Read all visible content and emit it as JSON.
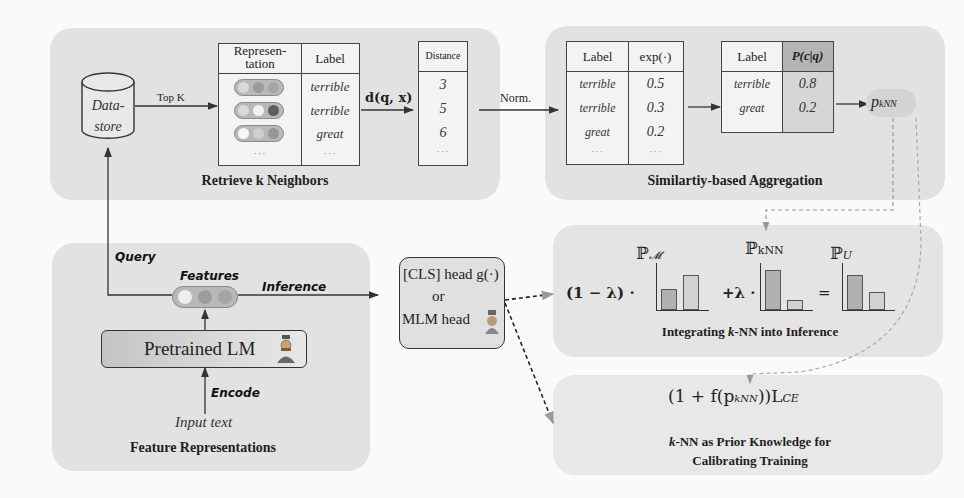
{
  "colors": {
    "background": "#fafafa",
    "panel": "#e2e2e2",
    "header_highlight": "#bdbdbd",
    "line": "#333333",
    "dashed": "#999999"
  },
  "retrieve": {
    "title": "Retrieve k Neighbors",
    "datastore_label_line1": "Data-",
    "datastore_label_line2": "store",
    "topk_label": "Top K",
    "table": {
      "headers": [
        "Represen-tation",
        "Label"
      ],
      "header_line1": "Represen-",
      "header_line2": "tation",
      "label_header": "Label",
      "rows": [
        {
          "dots": [
            "#d8d8d8",
            "#9a9a9a",
            "#a5a5a5"
          ],
          "label": "terrible"
        },
        {
          "dots": [
            "#d8d8d8",
            "#f2f2f2",
            "#5e5e5e"
          ],
          "label": "terrible"
        },
        {
          "dots": [
            "#f7f7f7",
            "#cfcfcf",
            "#969696"
          ],
          "label": "great"
        }
      ],
      "ellipsis": "···"
    },
    "distance_fn": "d(q, x)"
  },
  "distance_table": {
    "header": "Distance",
    "values": [
      "3",
      "5",
      "6"
    ],
    "ellipsis": "···"
  },
  "norm_label": "Norm.",
  "aggregation": {
    "title": "Similartiy-based Aggregation",
    "exp_table": {
      "headers": [
        "Label",
        "exp(·)"
      ],
      "rows": [
        {
          "label": "terrible",
          "value": "0.5"
        },
        {
          "label": "terrible",
          "value": "0.3"
        },
        {
          "label": "great",
          "value": "0.2"
        }
      ],
      "ellipsis": "···"
    },
    "prob_table": {
      "headers": [
        "Label",
        "P(c|q)"
      ],
      "rows": [
        {
          "label": "terrible",
          "value": "0.8"
        },
        {
          "label": "great",
          "value": "0.2"
        }
      ]
    },
    "output": "p",
    "output_sub": "kNN"
  },
  "features": {
    "title": "Feature Representations",
    "query_label": "Query",
    "features_label": "Features",
    "inference_label": "Inference",
    "encoder_label": "Pretrained LM",
    "encode_label": "Encode",
    "input_label": "Input text",
    "feature_dots": [
      "#eeeeee",
      "#9c9c9c",
      "#a4a4a4"
    ]
  },
  "head": {
    "line1": "[CLS] head g(·)",
    "line2": "or",
    "line3": "MLM head"
  },
  "integration": {
    "title_pre": "Integrating ",
    "title_k": "k",
    "title_post": "-NN into Inference",
    "coef1": "(1 − λ) ·",
    "coef2": "+λ ·",
    "equals": "=",
    "dist_labels": [
      "ℙ",
      "ℙ",
      "ℙ"
    ],
    "dist_subs": [
      "𝓜",
      "kNN",
      "U"
    ],
    "charts": [
      {
        "name": "P_M",
        "values": [
          0.45,
          0.75
        ]
      },
      {
        "name": "P_kNN",
        "values": [
          0.85,
          0.22
        ]
      },
      {
        "name": "P_U",
        "values": [
          0.75,
          0.38
        ]
      }
    ]
  },
  "calibration": {
    "formula": "(1 + f(p",
    "formula_sub": "kNN",
    "formula_post": "))L",
    "formula_post_sub": "CE",
    "title_k": "k",
    "title_line1": "-NN as Prior Knowledge for",
    "title_line2": "Calibrating Training"
  }
}
